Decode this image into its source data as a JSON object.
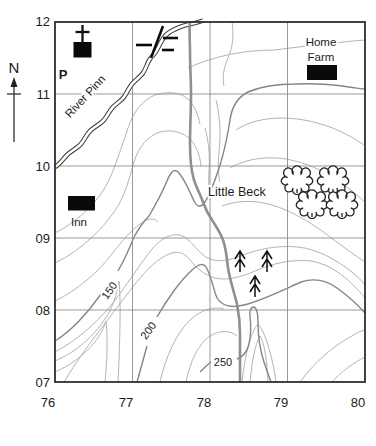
{
  "map": {
    "compass": {
      "label": "N"
    },
    "grid": {
      "eastings": [
        "76",
        "77",
        "78",
        "79",
        "80"
      ],
      "northings": [
        "12",
        "11",
        "10",
        "09",
        "08",
        "07"
      ]
    },
    "features": {
      "river_label": "River Pinn",
      "stream_label": "Little Beck",
      "inn_label": "Inn",
      "farm_label_line1": "Home",
      "farm_label_line2": "Farm",
      "parking_label": "P"
    },
    "contours": {
      "labels": [
        "150",
        "200",
        "250"
      ]
    },
    "colors": {
      "ink": "#1c1c1c",
      "frame": "#2e2e2e",
      "grid_line": "#8d8d8d",
      "contour_light": "#b4b4b4",
      "contour_index": "#858585",
      "stream": "#8f8f8f",
      "river_outline": "#3c3c3c",
      "building_fill": "#0a0a0a",
      "background": "#ffffff"
    }
  }
}
